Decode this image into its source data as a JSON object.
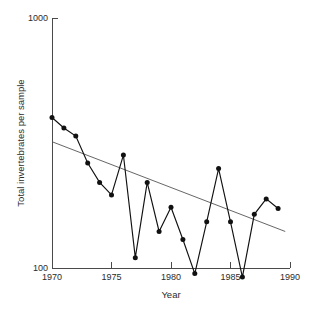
{
  "chart_data": {
    "type": "line",
    "title": "",
    "xlabel": "Year",
    "ylabel": "Total invertebrates per sample",
    "yscale": "log",
    "xlim": [
      1970,
      1990
    ],
    "ylim": [
      100,
      1000
    ],
    "xticks": [
      1970,
      1975,
      1980,
      1985,
      1990
    ],
    "xticklabels": [
      "1970",
      "1975",
      "1980",
      "1985",
      "1990"
    ],
    "yticks": [
      100,
      1000
    ],
    "yticklabels": [
      "100",
      "1000"
    ],
    "grid": false,
    "legend": null,
    "x": [
      1970,
      1971,
      1972,
      1973,
      1974,
      1975,
      1976,
      1977,
      1978,
      1979,
      1980,
      1981,
      1982,
      1983,
      1984,
      1985,
      1986,
      1987,
      1988,
      1989
    ],
    "values": [
      400,
      363,
      337,
      263,
      220,
      196,
      283,
      110,
      220,
      140,
      175,
      130,
      95,
      153,
      250,
      153,
      92,
      164,
      189,
      173
    ],
    "series": [
      {
        "name": "Total invertebrates per sample",
        "marker": "filled-circle",
        "values": [
          400,
          363,
          337,
          263,
          220,
          196,
          283,
          110,
          220,
          140,
          175,
          130,
          95,
          153,
          250,
          153,
          92,
          164,
          189,
          173
        ]
      }
    ],
    "annotations": [
      {
        "name": "linear-trend-line",
        "type": "trend-line",
        "x": [
          1970,
          1989.6
        ],
        "values": [
          320,
          140
        ]
      }
    ]
  },
  "axes": {
    "x_title": "Year",
    "y_title": "Total invertebrates per sample",
    "x_tick_labels": [
      "1970",
      "1975",
      "1980",
      "1985",
      "1990"
    ],
    "y_tick_labels": [
      "1000",
      "100"
    ]
  },
  "colors": {
    "series": "#111111",
    "trend": "#555555",
    "axis": "#4a4a4a",
    "text": "#2b2b2b",
    "background": "#ffffff"
  }
}
